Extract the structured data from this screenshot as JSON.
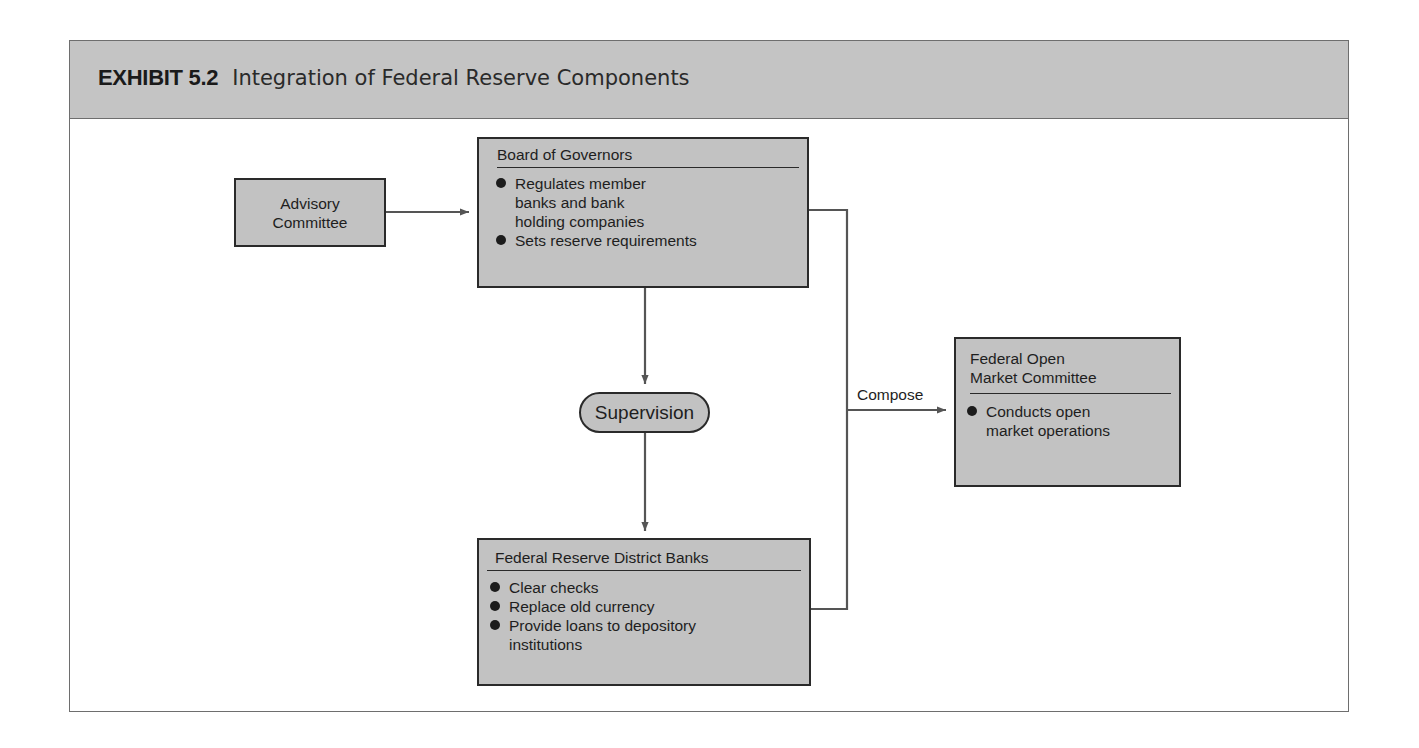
{
  "exhibit": {
    "label": "EXHIBIT 5.2",
    "title": "Integration of Federal Reserve Components"
  },
  "nodes": {
    "advisory": {
      "lines": [
        "Advisory",
        "Committee"
      ]
    },
    "board": {
      "title": "Board of Governors",
      "bullets": [
        [
          "Regulates member",
          "banks and bank",
          "holding companies"
        ],
        [
          "Sets reserve requirements"
        ]
      ]
    },
    "supervision": {
      "label": "Supervision"
    },
    "district": {
      "title": "Federal Reserve District Banks",
      "bullets": [
        [
          "Clear checks"
        ],
        [
          "Replace old currency"
        ],
        [
          "Provide loans to depository",
          "institutions"
        ]
      ]
    },
    "fomc": {
      "title_lines": [
        "Federal Open",
        "Market Committee"
      ],
      "bullets": [
        [
          "Conducts open",
          "market operations"
        ]
      ]
    }
  },
  "edges": {
    "compose_label": "Compose"
  },
  "colors": {
    "header_bg": "#c4c4c4",
    "box_fill": "#c2c2c2",
    "box_border": "#2a2a2a",
    "connector": "#555555",
    "frame_border": "#6e6e6e"
  }
}
